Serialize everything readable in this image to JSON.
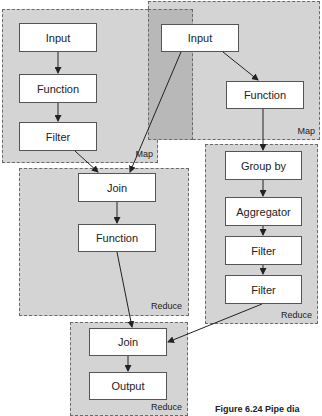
{
  "groups": [
    {
      "id": "map1",
      "label": "Map"
    },
    {
      "id": "map2",
      "label": "Map"
    },
    {
      "id": "reduce1",
      "label": "Reduce"
    },
    {
      "id": "reduce2",
      "label": "Reduce"
    },
    {
      "id": "reduce3",
      "label": "Reduce"
    }
  ],
  "nodes": {
    "map1_input": "Input",
    "map1_function": "Function",
    "map1_filter": "Filter",
    "map2_input": "Input",
    "map2_function": "Function",
    "reduce1_join": "Join",
    "reduce1_function": "Function",
    "reduce2_groupby": "Group by",
    "reduce2_aggregator": "Aggregator",
    "reduce2_filter1": "Filter",
    "reduce2_filter2": "Filter",
    "reduce3_join": "Join",
    "reduce3_output": "Output"
  },
  "caption": "Figure 6.24   Pipe dia"
}
